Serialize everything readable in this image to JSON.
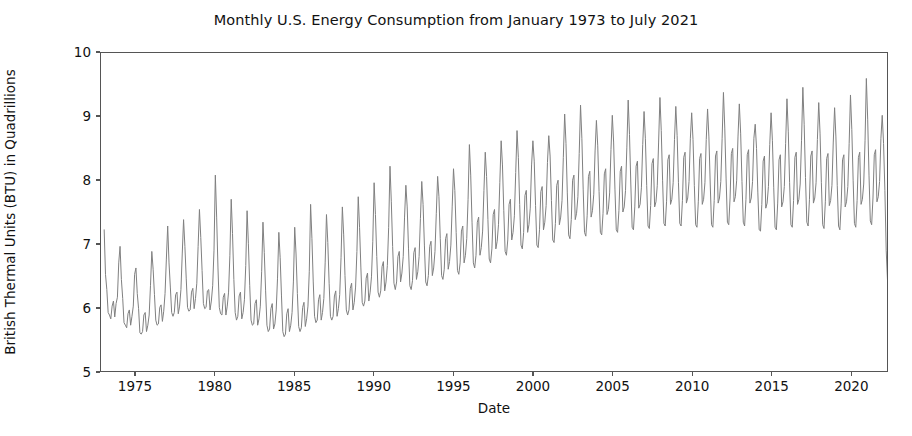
{
  "chart_data": {
    "type": "line",
    "title": "Monthly U.S. Energy Consumption from January 1973 to July 2021",
    "xlabel": "Date",
    "ylabel": "British Thermal Units (BTU) in Quadrillions",
    "grid": false,
    "legend": "none",
    "line_color": "#808080",
    "line_width": 1.0,
    "xlim": [
      1972.8,
      2022.3
    ],
    "ylim": [
      5,
      10
    ],
    "yticks": [
      5,
      6,
      7,
      8,
      9,
      10
    ],
    "ytick_labels": [
      "5",
      "6",
      "7",
      "8",
      "9",
      "10"
    ],
    "xticks": [
      1975,
      1980,
      1985,
      1990,
      1995,
      2000,
      2005,
      2010,
      2015,
      2020
    ],
    "xtick_labels": [
      "1975",
      "1980",
      "1985",
      "1990",
      "1995",
      "2000",
      "2005",
      "2010",
      "2015",
      "2020"
    ],
    "x_start": 1973.0,
    "x_step": 0.0833333,
    "series": [
      {
        "name": "U.S. Monthly Energy Consumption",
        "units": "Quadrillion BTU",
        "values": [
          7.22,
          6.52,
          6.28,
          5.92,
          5.88,
          5.82,
          6.02,
          6.1,
          5.85,
          6.06,
          6.16,
          6.7,
          6.96,
          6.44,
          6.14,
          5.76,
          5.72,
          5.68,
          5.9,
          5.96,
          5.72,
          5.86,
          6.02,
          6.52,
          6.62,
          6.22,
          5.98,
          5.6,
          5.58,
          5.62,
          5.88,
          5.92,
          5.62,
          5.72,
          5.88,
          6.34,
          6.88,
          6.6,
          6.2,
          5.8,
          5.72,
          5.74,
          6.0,
          6.04,
          5.78,
          5.94,
          6.22,
          6.76,
          7.28,
          6.7,
          6.32,
          5.92,
          5.86,
          5.92,
          6.2,
          6.24,
          5.9,
          6.02,
          6.28,
          6.84,
          7.38,
          6.96,
          6.46,
          6.0,
          5.94,
          5.96,
          6.24,
          6.3,
          5.98,
          6.14,
          6.38,
          6.96,
          7.54,
          7.1,
          6.58,
          6.06,
          5.98,
          6.0,
          6.26,
          6.28,
          5.96,
          6.1,
          6.34,
          6.9,
          8.08,
          7.42,
          6.62,
          6.0,
          5.9,
          5.88,
          6.16,
          6.22,
          5.88,
          6.02,
          6.24,
          6.82,
          7.7,
          7.16,
          6.44,
          5.92,
          5.8,
          5.86,
          6.18,
          6.24,
          5.82,
          5.92,
          6.12,
          6.66,
          7.52,
          7.0,
          6.34,
          5.8,
          5.72,
          5.74,
          6.06,
          6.12,
          5.72,
          5.82,
          6.02,
          6.56,
          7.34,
          6.86,
          6.26,
          5.72,
          5.62,
          5.66,
          5.98,
          6.06,
          5.66,
          5.74,
          5.96,
          6.46,
          7.18,
          6.78,
          6.18,
          5.62,
          5.54,
          5.58,
          5.9,
          5.98,
          5.62,
          5.72,
          5.92,
          6.4,
          7.26,
          6.84,
          6.22,
          5.7,
          5.62,
          5.68,
          6.0,
          6.08,
          5.7,
          5.82,
          6.02,
          6.56,
          7.62,
          7.08,
          6.4,
          5.86,
          5.76,
          5.8,
          6.12,
          6.2,
          5.8,
          5.92,
          6.14,
          6.7,
          7.46,
          7.02,
          6.38,
          5.86,
          5.8,
          5.86,
          6.18,
          6.26,
          5.86,
          5.98,
          6.2,
          6.78,
          7.58,
          7.14,
          6.5,
          5.96,
          5.88,
          5.96,
          6.3,
          6.38,
          5.96,
          6.08,
          6.32,
          6.88,
          7.74,
          7.26,
          6.62,
          6.08,
          6.02,
          6.1,
          6.46,
          6.54,
          6.1,
          6.24,
          6.48,
          7.04,
          7.96,
          7.46,
          6.8,
          6.24,
          6.16,
          6.26,
          6.64,
          6.72,
          6.26,
          6.4,
          6.66,
          7.26,
          8.22,
          7.66,
          6.96,
          6.38,
          6.28,
          6.4,
          6.8,
          6.88,
          6.4,
          6.54,
          6.8,
          7.42,
          7.92,
          7.58,
          6.92,
          6.34,
          6.28,
          6.42,
          6.86,
          6.94,
          6.44,
          6.56,
          6.8,
          7.4,
          7.98,
          7.62,
          6.98,
          6.4,
          6.34,
          6.5,
          6.96,
          7.04,
          6.5,
          6.62,
          6.88,
          7.48,
          8.06,
          7.74,
          7.08,
          6.5,
          6.44,
          6.6,
          7.08,
          7.16,
          6.6,
          6.72,
          6.98,
          7.58,
          8.18,
          7.84,
          7.18,
          6.58,
          6.52,
          6.7,
          7.2,
          7.28,
          6.7,
          6.82,
          7.08,
          7.7,
          8.56,
          8.08,
          7.34,
          6.7,
          6.62,
          6.82,
          7.34,
          7.42,
          6.82,
          6.94,
          7.2,
          7.84,
          8.44,
          8.06,
          7.38,
          6.76,
          6.7,
          6.92,
          7.46,
          7.54,
          6.92,
          7.04,
          7.3,
          7.96,
          8.62,
          8.24,
          7.52,
          6.88,
          6.82,
          7.06,
          7.62,
          7.7,
          7.06,
          7.18,
          7.44,
          8.12,
          8.78,
          8.36,
          7.62,
          6.98,
          6.92,
          7.18,
          7.76,
          7.84,
          7.18,
          7.3,
          7.56,
          8.24,
          8.62,
          8.3,
          7.6,
          6.98,
          6.94,
          7.22,
          7.82,
          7.9,
          7.22,
          7.34,
          7.6,
          8.28,
          8.7,
          8.38,
          7.68,
          7.06,
          7.02,
          7.32,
          7.92,
          8.0,
          7.3,
          7.42,
          7.68,
          8.36,
          9.04,
          8.58,
          7.8,
          7.14,
          7.08,
          7.38,
          8.0,
          8.08,
          7.38,
          7.48,
          7.74,
          8.42,
          9.18,
          8.66,
          7.86,
          7.18,
          7.12,
          7.44,
          8.06,
          8.14,
          7.42,
          7.52,
          7.78,
          8.46,
          8.94,
          8.54,
          7.82,
          7.18,
          7.14,
          7.48,
          8.1,
          8.18,
          7.46,
          7.54,
          7.8,
          8.48,
          9.02,
          8.6,
          7.86,
          7.22,
          7.18,
          7.52,
          8.14,
          8.22,
          7.5,
          7.58,
          7.84,
          8.52,
          9.26,
          8.72,
          7.94,
          7.26,
          7.22,
          7.58,
          8.22,
          8.3,
          7.56,
          7.62,
          7.88,
          8.56,
          9.08,
          8.66,
          7.92,
          7.28,
          7.24,
          7.6,
          8.26,
          8.34,
          7.58,
          7.66,
          7.92,
          8.6,
          9.3,
          8.78,
          8.0,
          7.32,
          7.28,
          7.66,
          8.32,
          8.4,
          7.62,
          7.7,
          7.96,
          8.64,
          9.16,
          8.7,
          7.96,
          7.32,
          7.28,
          7.68,
          8.36,
          8.44,
          7.64,
          7.72,
          7.98,
          8.66,
          9.06,
          8.64,
          7.92,
          7.3,
          7.26,
          7.66,
          8.34,
          8.42,
          7.62,
          7.7,
          7.96,
          8.64,
          9.12,
          8.68,
          7.94,
          7.3,
          7.26,
          7.68,
          8.38,
          8.46,
          7.64,
          7.72,
          7.98,
          8.66,
          9.38,
          8.82,
          8.02,
          7.34,
          7.3,
          7.72,
          8.42,
          8.5,
          7.66,
          7.74,
          8.0,
          8.68,
          9.2,
          8.74,
          7.98,
          7.34,
          7.28,
          7.7,
          8.4,
          8.48,
          7.64,
          7.72,
          7.98,
          8.66,
          8.88,
          8.5,
          7.8,
          7.22,
          7.2,
          7.62,
          8.3,
          8.38,
          7.56,
          7.64,
          7.9,
          8.56,
          9.06,
          8.62,
          7.88,
          7.26,
          7.22,
          7.64,
          8.32,
          8.4,
          7.58,
          7.66,
          7.9,
          8.58,
          9.28,
          8.76,
          7.96,
          7.3,
          7.26,
          7.68,
          8.36,
          8.44,
          7.62,
          7.7,
          7.94,
          8.62,
          9.46,
          8.88,
          8.04,
          7.34,
          7.28,
          7.7,
          8.38,
          8.46,
          7.64,
          7.72,
          7.96,
          8.64,
          9.22,
          8.74,
          7.96,
          7.3,
          7.24,
          7.66,
          8.34,
          8.42,
          7.6,
          7.68,
          7.92,
          8.6,
          9.14,
          8.68,
          7.92,
          7.28,
          7.22,
          7.64,
          8.32,
          8.4,
          7.58,
          7.66,
          7.9,
          8.58,
          9.34,
          8.8,
          8.0,
          7.32,
          7.26,
          7.68,
          8.36,
          8.44,
          7.62,
          7.7,
          7.94,
          8.62,
          9.6,
          8.96,
          8.08,
          7.36,
          7.3,
          7.72,
          8.4,
          8.48,
          7.66,
          7.74,
          7.98,
          8.66,
          9.02,
          8.58,
          7.84,
          6.9,
          6.42,
          6.68,
          7.44,
          7.58,
          7.02,
          7.16,
          7.5,
          8.12,
          8.78,
          8.34,
          7.7,
          7.34,
          7.4,
          7.72,
          8.2
        ]
      }
    ]
  }
}
